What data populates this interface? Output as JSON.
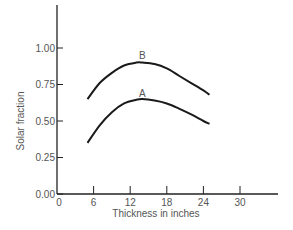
{
  "chart_data": {
    "type": "line",
    "title": "",
    "xlabel": "Thickness in inches",
    "ylabel": "Solar fraction",
    "xlim": [
      0,
      36
    ],
    "ylim": [
      0,
      1.15
    ],
    "x_ticks": [
      0,
      6,
      12,
      18,
      24,
      30
    ],
    "x_tick_labels": [
      "0",
      "6",
      "12",
      "18",
      "24",
      "30"
    ],
    "y_ticks": [
      0,
      0.25,
      0.5,
      0.75,
      1.0
    ],
    "y_tick_labels": [
      "0.00",
      "0.25",
      "0.50",
      "0.75",
      "1.00"
    ],
    "grid": false,
    "legend": "inline labels above curve peaks",
    "series": [
      {
        "name": "B",
        "x": [
          5,
          7,
          9,
          11,
          13,
          14,
          16,
          18,
          20,
          22,
          24,
          25
        ],
        "values": [
          0.65,
          0.76,
          0.83,
          0.88,
          0.9,
          0.9,
          0.89,
          0.86,
          0.81,
          0.76,
          0.71,
          0.68
        ],
        "label_position": [
          14,
          0.93
        ]
      },
      {
        "name": "A",
        "x": [
          5,
          7,
          9,
          11,
          13,
          14,
          16,
          18,
          20,
          22,
          24,
          25
        ],
        "values": [
          0.35,
          0.47,
          0.56,
          0.62,
          0.645,
          0.65,
          0.64,
          0.62,
          0.585,
          0.545,
          0.5,
          0.48
        ],
        "label_position": [
          14,
          0.67
        ]
      }
    ]
  },
  "colors": {
    "line": "#1a1a1a",
    "axis": "#222222",
    "text": "#555555",
    "background": "#ffffff"
  }
}
